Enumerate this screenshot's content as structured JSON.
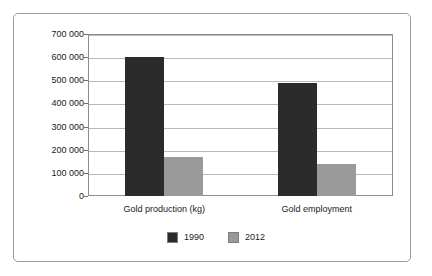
{
  "chart_data": {
    "type": "bar",
    "title": "",
    "subtitle": "",
    "xlabel": "",
    "ylabel": "",
    "categories": [
      "Gold production (kg)",
      "Gold employment"
    ],
    "series": [
      {
        "name": "1990",
        "color": "#2b2b2b",
        "values": [
          600000,
          490000
        ]
      },
      {
        "name": "2012",
        "color": "#9a9a9a",
        "values": [
          170000,
          140000
        ]
      }
    ],
    "ylim": [
      0,
      700000
    ],
    "ytick_values": [
      0,
      100000,
      200000,
      300000,
      400000,
      500000,
      600000,
      700000
    ],
    "ytick_labels": [
      "0",
      "100 000",
      "200 000",
      "300 000",
      "400 000",
      "500 000",
      "600 000",
      "700 000"
    ],
    "grid": true,
    "grid_axis": "y",
    "legend_position": "bottom-center",
    "legend_entries": [
      "1990",
      "2012"
    ],
    "plot_border": true,
    "outer_frame": true,
    "background_color": "#ffffff",
    "gridline_color": "#b9b9b9",
    "axis_color": "#8d8d8d",
    "text_color": "#1a1a1a"
  }
}
